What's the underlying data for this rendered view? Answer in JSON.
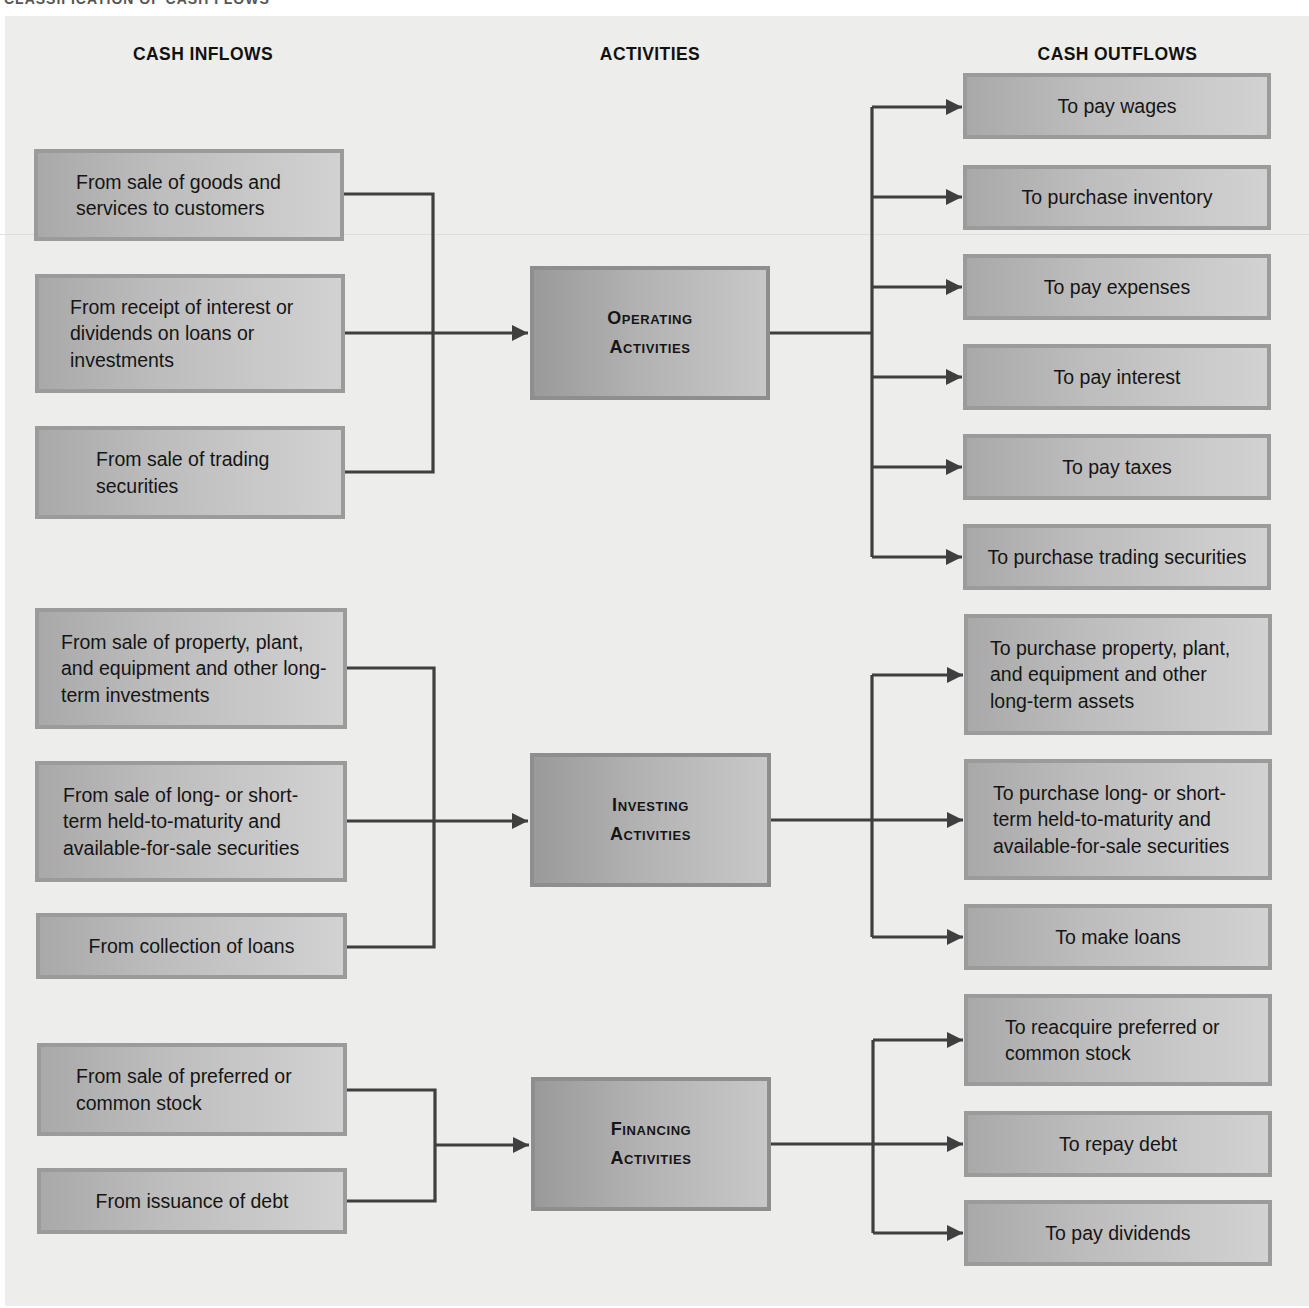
{
  "header": {
    "clipped_title": "CLASSIFICATION OF CASH FLOWS",
    "columns": {
      "inflows": "CASH INFLOWS",
      "activities": "ACTIVITIES",
      "outflows": "CASH OUTFLOWS"
    }
  },
  "colors": {
    "page_background": "#ffffff",
    "panel_background": "#ededeb",
    "box_border": "#9b9b9b",
    "box_gradient_dark": "#a9a9a9",
    "box_gradient_light": "#d2d2d2",
    "connector": "#3f3f3f"
  },
  "groups": [
    {
      "id": "operating",
      "activity": {
        "line1": "Operating",
        "line2": "Activities"
      },
      "inflows": [
        "From sale of goods and services to customers",
        "From receipt of interest or dividends on loans or investments",
        "From sale of trading securities"
      ],
      "outflows": [
        "To pay wages",
        "To purchase inventory",
        "To pay expenses",
        "To pay interest",
        "To pay taxes",
        "To purchase trading securities"
      ]
    },
    {
      "id": "investing",
      "activity": {
        "line1": "Investing",
        "line2": "Activities"
      },
      "inflows": [
        "From sale of property, plant, and equipment and other long-term investments",
        "From sale of long- or short-term held-to-maturity and available-for-sale securities",
        "From collection of loans"
      ],
      "outflows": [
        "To purchase property, plant, and equipment and other long-term assets",
        "To purchase long- or short-term held-to-maturity and available-for-sale securities",
        "To make loans"
      ]
    },
    {
      "id": "financing",
      "activity": {
        "line1": "Financing",
        "line2": "Activities"
      },
      "inflows": [
        "From sale of preferred or common stock",
        "From issuance of debt"
      ],
      "outflows": [
        "To reacquire preferred or common stock",
        "To repay debt",
        "To pay dividends"
      ]
    }
  ]
}
